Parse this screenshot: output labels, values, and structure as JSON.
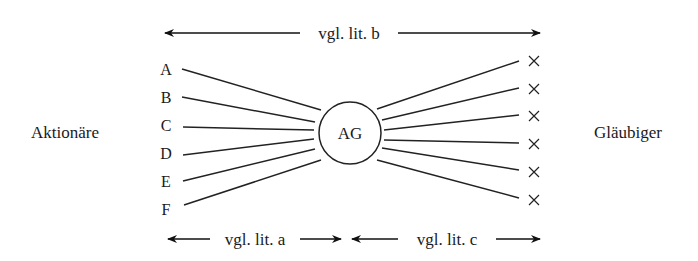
{
  "left_group": {
    "label": "Aktionäre",
    "members": [
      "A",
      "B",
      "C",
      "D",
      "E",
      "F"
    ]
  },
  "right_group": {
    "label": "Gläubiger",
    "member_marker": "×",
    "member_count": 6
  },
  "center_node": {
    "label": "AG"
  },
  "arrows": {
    "top": "vgl. lit. b",
    "bottom_left": "vgl. lit. a",
    "bottom_right": "vgl. lit. c"
  }
}
